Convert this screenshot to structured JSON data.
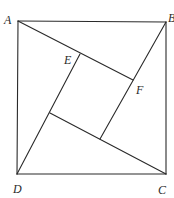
{
  "diagram": {
    "type": "geometry",
    "points": {
      "A": {
        "label": "A",
        "x": 18,
        "y": 21
      },
      "B": {
        "label": "B",
        "x": 166,
        "y": 22
      },
      "C": {
        "label": "C",
        "x": 166,
        "y": 174
      },
      "D": {
        "label": "D",
        "x": 17,
        "y": 174
      },
      "E": {
        "label": "E",
        "x": 80,
        "y": 54
      },
      "F": {
        "label": "F",
        "x": 133,
        "y": 80
      },
      "G": {
        "label": "",
        "x": 50,
        "y": 113
      },
      "H": {
        "label": "",
        "x": 100,
        "y": 139
      }
    },
    "segments": [
      [
        "A",
        "B"
      ],
      [
        "B",
        "C"
      ],
      [
        "C",
        "D"
      ],
      [
        "D",
        "A"
      ],
      [
        "A",
        "F"
      ],
      [
        "B",
        "G"
      ],
      [
        "C",
        "G"
      ],
      [
        "D",
        "E"
      ],
      [
        "E",
        "H"
      ],
      [
        "F",
        "H"
      ]
    ],
    "labels": {
      "A": "A",
      "B": "B",
      "C": "C",
      "D": "D",
      "E": "E",
      "F": "F"
    },
    "colors": {
      "stroke": "#2a2a2a",
      "background": "#ffffff"
    }
  }
}
